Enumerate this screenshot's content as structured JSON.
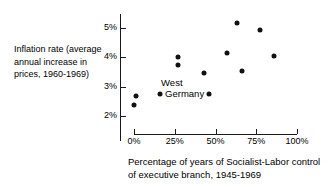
{
  "chart_data": {
    "type": "scatter",
    "title": "",
    "xlabel": "Percentage of years of Socialist-Labor control of executive branch, 1945-1969",
    "ylabel": "Inflation rate (average annual increase in prices, 1960-1969)",
    "xlim": [
      -8,
      110
    ],
    "ylim": [
      1.7,
      5.4
    ],
    "grid": false,
    "legend": "none",
    "xticks": [
      {
        "value": 0,
        "label": "0%"
      },
      {
        "value": 25,
        "label": "25%"
      },
      {
        "value": 50,
        "label": "50%"
      },
      {
        "value": 75,
        "label": "75%"
      },
      {
        "value": 100,
        "label": "100%"
      }
    ],
    "yticks": [
      {
        "value": 5,
        "label": "5%"
      },
      {
        "value": 4,
        "label": "4%"
      },
      {
        "value": 3,
        "label": "3%"
      },
      {
        "value": 2,
        "label": "2%"
      }
    ],
    "points": [
      {
        "name": "Denmark",
        "label": "Denmark",
        "x": 63,
        "y": 5.17,
        "label_pos": "left"
      },
      {
        "name": "Finland",
        "label": "Finland",
        "x": 77,
        "y": 4.93,
        "label_pos": "right"
      },
      {
        "name": "Netherlands",
        "label": "Netherlands",
        "x": 57,
        "y": 4.15,
        "label_pos": "above"
      },
      {
        "name": "Sweden",
        "label": "Sweden",
        "x": 86,
        "y": 4.05,
        "label_pos": "right"
      },
      {
        "name": "France",
        "label": "France",
        "x": 27,
        "y": 4.02,
        "label_pos": "left"
      },
      {
        "name": "Italy",
        "label": "Italy",
        "x": 27,
        "y": 3.74,
        "label_pos": "left"
      },
      {
        "name": "Norway",
        "label": "Norway",
        "x": 66,
        "y": 3.55,
        "label_pos": "right"
      },
      {
        "name": "Britain",
        "label": "Britain",
        "x": 43,
        "y": 3.46,
        "label_pos": "above"
      },
      {
        "name": "West Germany",
        "label": "West Germany",
        "x": 16,
        "y": 2.75,
        "label_pos": "right-two-line"
      },
      {
        "name": "Belgium",
        "label": "Belgium",
        "x": 46,
        "y": 2.75,
        "label_pos": "right"
      },
      {
        "name": "Canada",
        "label": "Canada",
        "x": 1,
        "y": 2.68,
        "label_pos": "left"
      },
      {
        "name": "United States",
        "label": "United States",
        "x": 0,
        "y": 2.37,
        "label_pos": "right"
      }
    ]
  },
  "axis": {
    "y_caption": "Inflation rate (average annual increase in prices, 1960-1969)",
    "x_caption": "Percentage of years of Socialist-Labor control of executive branch, 1945-1969"
  }
}
